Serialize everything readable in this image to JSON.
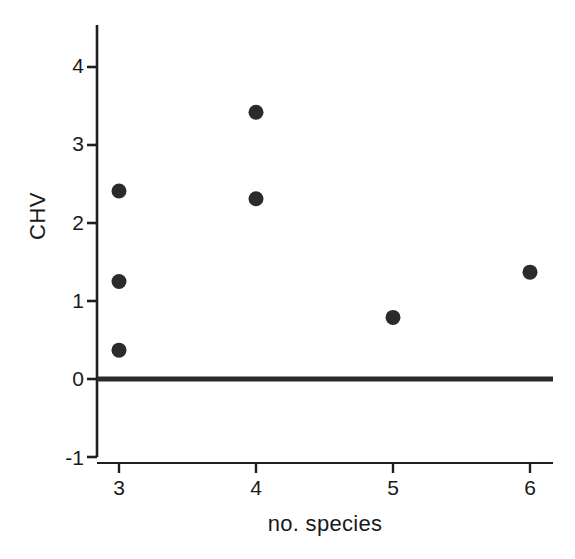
{
  "chart_data": {
    "type": "scatter",
    "title": "",
    "xlabel": "no. species",
    "ylabel": "CHV",
    "xlim": [
      2.55,
      6.35
    ],
    "ylim": [
      -1,
      4.45
    ],
    "xticks": [
      "3",
      "4",
      "5",
      "6"
    ],
    "xtick_values": [
      3,
      4,
      5,
      6
    ],
    "yticks": [
      "4",
      "3",
      "2",
      "1",
      "0",
      "-1"
    ],
    "ytick_values": [
      4,
      3,
      2,
      1,
      0,
      -1
    ],
    "grid": false,
    "legend": "none",
    "marker": {
      "shape": "circle",
      "color": "#2b2b2b",
      "size_px": 15
    },
    "reference_line": {
      "orientation": "horizontal",
      "y": 0,
      "color": "#2b2b2b",
      "width_px": 5
    },
    "points": [
      {
        "x": 3,
        "y": 2.41
      },
      {
        "x": 3,
        "y": 1.25
      },
      {
        "x": 3,
        "y": 0.37
      },
      {
        "x": 4,
        "y": 3.42
      },
      {
        "x": 4,
        "y": 2.31
      },
      {
        "x": 5,
        "y": 0.79
      },
      {
        "x": 6,
        "y": 1.37
      }
    ]
  },
  "axis": {
    "y_title": "CHV",
    "x_title": "no. species"
  },
  "colors": {
    "ink": "#1f1f1f",
    "marker": "#2b2b2b",
    "background": "#ffffff"
  }
}
